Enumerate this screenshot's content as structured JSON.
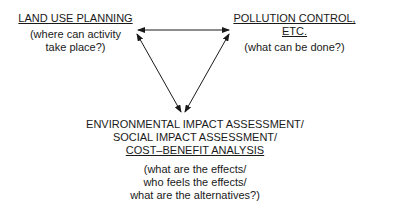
{
  "diagram": {
    "nodes": {
      "land_use": {
        "title": "LAND USE PLANNING",
        "subtitle_lines": [
          "(where can activity",
          "take place?)"
        ]
      },
      "pollution": {
        "title": "POLLUTION CONTROL, ETC.",
        "subtitle_lines": [
          "(what can be done?)"
        ]
      },
      "assessment": {
        "lines": [
          "ENVIRONMENTAL IMPACT ASSESSMENT/",
          "SOCIAL IMPACT ASSESSMENT/"
        ],
        "underlined_line": "COST–BENEFIT ANALYSIS",
        "subtitle_lines": [
          "(what are the effects/",
          "who feels the effects/",
          "what are the alternatives?)"
        ]
      }
    },
    "edges": [
      {
        "from": "land_use",
        "to": "pollution",
        "type": "bidirectional"
      },
      {
        "from": "land_use",
        "to": "assessment",
        "type": "bidirectional"
      },
      {
        "from": "pollution",
        "to": "assessment",
        "type": "bidirectional"
      }
    ],
    "colors": {
      "ink": "#1a1a1a",
      "background": "#ffffff"
    }
  }
}
